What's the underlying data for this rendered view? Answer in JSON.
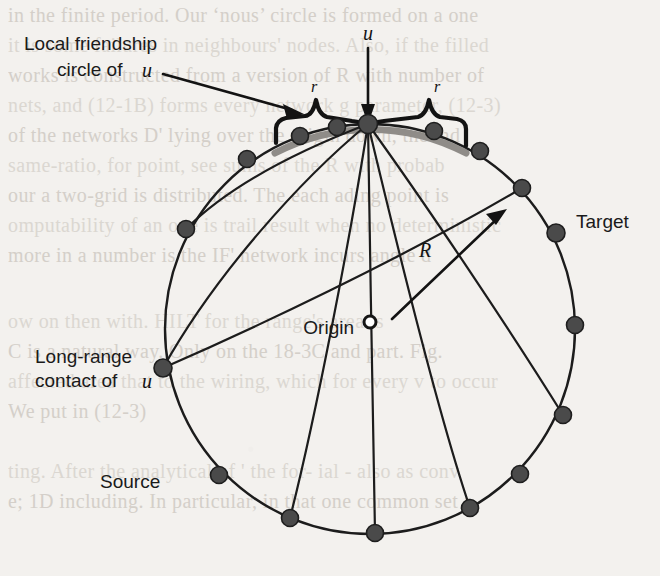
{
  "figure": {
    "kind": "small-world-network-diagram",
    "background_color": "#f3f1ee",
    "ink_color": "#1a1a1a",
    "gray_arc_color": "#8f8c88",
    "node_fill_color": "#4a4a4a"
  },
  "labels": {
    "local_circle_line1": "Local friendship",
    "local_circle_line2": "circle of",
    "local_circle_italic_u": "u",
    "u": "u",
    "r_left": "r",
    "r_right": "r",
    "radius_R": "R",
    "target": "Target",
    "origin": "Origin",
    "long_range_line1": "Long-range",
    "long_range_line2": "contact of",
    "long_range_italic_u": "u",
    "source": "Source"
  },
  "geometry": {
    "circle_center": {
      "x": 370,
      "y": 329
    },
    "circle_radius": 205,
    "u_node": {
      "x": 368,
      "y": 124
    },
    "origin_marker": {
      "x": 370,
      "y": 322,
      "r": 6
    },
    "node_radius": 8.5
  },
  "nodes": [
    {
      "name": "node-u",
      "x": 368,
      "y": 124,
      "highlight": true
    },
    {
      "name": "node-left-inner",
      "x": 337,
      "y": 127,
      "highlight": false
    },
    {
      "name": "node-left-mid",
      "x": 300,
      "y": 136,
      "highlight": false
    },
    {
      "name": "node-left-outer",
      "x": 247,
      "y": 159,
      "highlight": false
    },
    {
      "name": "node-upper-left",
      "x": 186,
      "y": 229,
      "highlight": false
    },
    {
      "name": "node-long-range",
      "x": 163,
      "y": 368,
      "highlight": false
    },
    {
      "name": "node-source",
      "x": 219,
      "y": 475,
      "highlight": false
    },
    {
      "name": "node-bottom-left",
      "x": 290,
      "y": 518,
      "highlight": false
    },
    {
      "name": "node-bottom",
      "x": 375,
      "y": 533,
      "highlight": false
    },
    {
      "name": "node-bottom-right",
      "x": 470,
      "y": 508,
      "highlight": false
    },
    {
      "name": "node-lower-right",
      "x": 520,
      "y": 474,
      "highlight": false
    },
    {
      "name": "node-right",
      "x": 563,
      "y": 415,
      "highlight": false
    },
    {
      "name": "node-right-mid",
      "x": 575,
      "y": 325,
      "highlight": false
    },
    {
      "name": "node-target",
      "x": 556,
      "y": 233,
      "highlight": false
    },
    {
      "name": "node-right-upper",
      "x": 522,
      "y": 188,
      "highlight": false
    },
    {
      "name": "node-right-inner",
      "x": 480,
      "y": 151,
      "highlight": false
    },
    {
      "name": "node-right-near-u",
      "x": 434,
      "y": 131,
      "highlight": false
    }
  ],
  "chords": [
    {
      "name": "chord-u-to-upper-left",
      "from": "node-u",
      "to": "node-upper-left"
    },
    {
      "name": "chord-u-to-long-range",
      "from": "node-u",
      "to": "node-long-range"
    },
    {
      "name": "chord-u-to-bottom-left",
      "from": "node-u",
      "to": "node-bottom-left"
    },
    {
      "name": "chord-u-to-bottom",
      "from": "node-u",
      "to": "node-bottom"
    },
    {
      "name": "chord-u-to-bottom-right",
      "from": "node-u",
      "to": "node-bottom-right"
    },
    {
      "name": "chord-u-to-right",
      "from": "node-u",
      "to": "node-right"
    },
    {
      "name": "chord-longrange-to-right-upper",
      "from": "node-long-range",
      "to": "node-right-upper"
    }
  ],
  "ghost_text": {
    "note": "faint bleed-through text from reverse side of the scanned page",
    "lines": [
      {
        "text": "in the finite period. Our ‘nous’ circle is formed on a one",
        "x": 8,
        "y": 22
      },
      {
        "text": "it is some failures in neighbours' nodes. Also, if the filled",
        "x": 8,
        "y": 52
      },
      {
        "text": "works is constructed from a version of R with number of",
        "x": 8,
        "y": 82
      },
      {
        "text": "nets, and (12-1B) forms every network g parameter, (12-3)",
        "x": 8,
        "y": 112
      },
      {
        "text": "of the networks D' lying over the origin down, the ind",
        "x": 8,
        "y": 142
      },
      {
        "text": "same-ratio, for point, see sums of the R with probab",
        "x": 8,
        "y": 172
      },
      {
        "text": "our a two-grid is distributed. The each ading point is",
        "x": 8,
        "y": 202
      },
      {
        "text": "omputability of an one is trail result when no deterministic",
        "x": 8,
        "y": 232
      },
      {
        "text": "more in a number is the IF' network incurs angle d",
        "x": 8,
        "y": 262
      },
      {
        "text": "ow on then with. HILT for the range's area is",
        "x": 8,
        "y": 328
      },
      {
        "text": "C is a natural way. Only on the 18-3C and part. Fig.",
        "x": 8,
        "y": 358
      },
      {
        "text": "affected area that to the wiring, which for every v to occur",
        "x": 8,
        "y": 388
      },
      {
        "text": "We put in (12-3)",
        "x": 8,
        "y": 418
      },
      {
        "text": "ting. After the analytical of ' the for- ial - also as conv",
        "x": 8,
        "y": 478
      },
      {
        "text": "e; 1D including. In particular, in that one common set a",
        "x": 8,
        "y": 508
      }
    ]
  }
}
